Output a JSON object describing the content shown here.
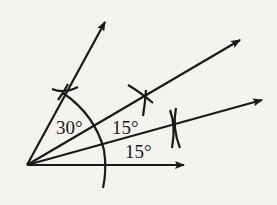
{
  "diagram": {
    "type": "angle-construction",
    "labels": {
      "angle_top": "30°",
      "angle_mid": "15°",
      "angle_bottom": "15°"
    },
    "colors": {
      "ink": "#1a1a1a",
      "paper": "#f4f3ef"
    }
  }
}
